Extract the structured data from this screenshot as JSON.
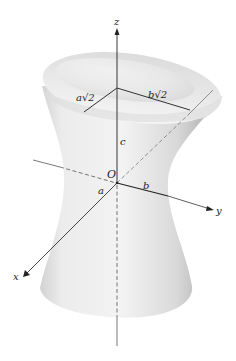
{
  "figure": {
    "axes": {
      "x_label": "x",
      "y_label": "y",
      "z_label": "z",
      "origin_label": "O"
    },
    "annotations": {
      "semi_axis_a": "a",
      "semi_axis_b": "b",
      "height_c": "c",
      "top_a": "a√2",
      "top_b": "b√2"
    },
    "colors": {
      "surface_light": "#f4f4f4",
      "surface_mid": "#d6d6d6",
      "surface_dark": "#a8a8a8",
      "line": "#333333",
      "background": "#ffffff"
    }
  }
}
